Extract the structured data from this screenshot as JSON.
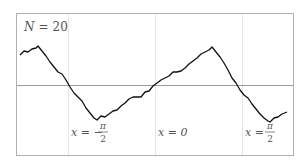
{
  "figure": {
    "annotation": "N = 20",
    "annotation_var": "N",
    "annotation_value": "20",
    "labels": [
      {
        "prefix": "x = −",
        "numerator": "π",
        "denominator": "2"
      },
      {
        "prefix": "x = 0"
      },
      {
        "prefix": "x =",
        "numerator": "π",
        "denominator": "2"
      }
    ],
    "colors": {
      "frame": "#aaaaaa",
      "axis": "#999999",
      "gridline": "#e6e6e6",
      "curve": "#111111"
    }
  },
  "chart_data": {
    "type": "line",
    "title": "",
    "annotation": "N = 20",
    "xlabel": "",
    "ylabel": "",
    "x_ticks": [
      "x = −π/2",
      "x = 0",
      "x = π/2"
    ],
    "series": [
      {
        "name": "N = 20",
        "points_px": [
          [
            20,
            55
          ],
          [
            24,
            51
          ],
          [
            28,
            52
          ],
          [
            32,
            49
          ],
          [
            36,
            48
          ],
          [
            38,
            46
          ],
          [
            42,
            51
          ],
          [
            46,
            56
          ],
          [
            50,
            62
          ],
          [
            54,
            67
          ],
          [
            58,
            72
          ],
          [
            62,
            74
          ],
          [
            66,
            80
          ],
          [
            70,
            87
          ],
          [
            74,
            93
          ],
          [
            78,
            97
          ],
          [
            82,
            101
          ],
          [
            86,
            108
          ],
          [
            90,
            113
          ],
          [
            94,
            118
          ],
          [
            97,
            120
          ],
          [
            101,
            116
          ],
          [
            105,
            117
          ],
          [
            109,
            114
          ],
          [
            113,
            111
          ],
          [
            117,
            110
          ],
          [
            121,
            106
          ],
          [
            125,
            103
          ],
          [
            129,
            99
          ],
          [
            133,
            97
          ],
          [
            137,
            97
          ],
          [
            141,
            97
          ],
          [
            145,
            92
          ],
          [
            149,
            91
          ],
          [
            153,
            86
          ],
          [
            157,
            83
          ],
          [
            161,
            80
          ],
          [
            165,
            78
          ],
          [
            169,
            76
          ],
          [
            173,
            72
          ],
          [
            177,
            72
          ],
          [
            181,
            71
          ],
          [
            185,
            68
          ],
          [
            189,
            64
          ],
          [
            193,
            61
          ],
          [
            197,
            58
          ],
          [
            201,
            54
          ],
          [
            205,
            52
          ],
          [
            209,
            50
          ],
          [
            212,
            47
          ],
          [
            216,
            52
          ],
          [
            220,
            57
          ],
          [
            224,
            63
          ],
          [
            228,
            70
          ],
          [
            232,
            78
          ],
          [
            236,
            83
          ],
          [
            240,
            90
          ],
          [
            244,
            95
          ],
          [
            248,
            98
          ],
          [
            252,
            104
          ],
          [
            256,
            109
          ],
          [
            260,
            114
          ],
          [
            264,
            118
          ],
          [
            268,
            121
          ],
          [
            270,
            122
          ],
          [
            274,
            118
          ],
          [
            278,
            117
          ],
          [
            282,
            114
          ],
          [
            287,
            112
          ]
        ]
      }
    ],
    "reference_line": "horizontal axis at y = 0",
    "grid": "vertical guides at x = -π/2, 0, π/2"
  }
}
